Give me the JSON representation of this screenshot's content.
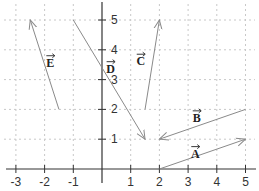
{
  "diagram": {
    "type": "coordinate-plane-vectors",
    "x_axis": {
      "min": -3,
      "max": 5,
      "ticks": [
        -3,
        -2,
        -1,
        1,
        2,
        3,
        4,
        5
      ]
    },
    "y_axis": {
      "min": 0,
      "max": 5,
      "ticks": [
        1,
        2,
        3,
        4,
        5
      ]
    },
    "grid": {
      "style": "dotted",
      "color": "#c8c8c8"
    },
    "axis_color": "#333333",
    "vector_color": "#8a8a8a",
    "vectors": [
      {
        "name": "A",
        "label": "A",
        "from": [
          2,
          0
        ],
        "to": [
          5,
          1
        ],
        "label_pos": [
          3.25,
          0.55
        ]
      },
      {
        "name": "B",
        "label": "B",
        "from": [
          5,
          2
        ],
        "to": [
          2,
          1
        ],
        "label_pos": [
          3.3,
          1.75
        ]
      },
      {
        "name": "C",
        "label": "C",
        "from": [
          1.5,
          2
        ],
        "to": [
          2,
          5
        ],
        "label_pos": [
          1.35,
          3.65
        ]
      },
      {
        "name": "D",
        "label": "D",
        "from": [
          -1,
          5
        ],
        "to": [
          1.5,
          1
        ],
        "label_pos": [
          0.3,
          3.4
        ]
      },
      {
        "name": "E",
        "label": "E",
        "from": [
          -1.5,
          2
        ],
        "to": [
          -2.5,
          5
        ],
        "label_pos": [
          -1.8,
          3.6
        ]
      }
    ]
  }
}
